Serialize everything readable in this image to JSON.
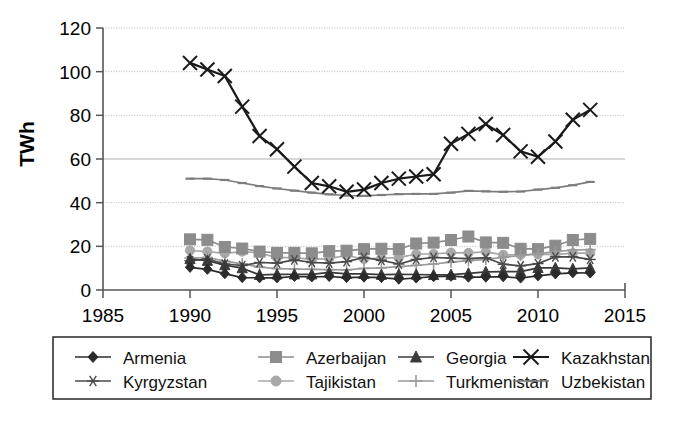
{
  "chart_data": {
    "type": "line",
    "title": "",
    "xlabel": "",
    "ylabel": "TWh",
    "xlim": [
      1985,
      2015
    ],
    "ylim": [
      0,
      120
    ],
    "xticks": [
      1985,
      1990,
      1995,
      2000,
      2005,
      2010,
      2015
    ],
    "yticks": [
      0,
      20,
      40,
      60,
      80,
      100,
      120
    ],
    "grid": "horizontal-dotted",
    "legend_position": "below-plot",
    "x": [
      1990,
      1991,
      1992,
      1993,
      1994,
      1995,
      1996,
      1997,
      1998,
      1999,
      2000,
      2001,
      2002,
      2003,
      2004,
      2005,
      2006,
      2007,
      2008,
      2009,
      2010,
      2011,
      2012,
      2013
    ],
    "series": [
      {
        "name": "Armenia",
        "marker": "diamond",
        "color": "#2b2b2b",
        "values": [
          10.4,
          9.5,
          7.5,
          5.7,
          5.6,
          5.6,
          6.2,
          6.0,
          6.2,
          5.7,
          5.9,
          5.7,
          5.0,
          5.5,
          6.1,
          6.3,
          5.9,
          5.9,
          6.1,
          5.5,
          6.5,
          7.4,
          7.9,
          7.8
        ]
      },
      {
        "name": "Azerbaijan",
        "marker": "square",
        "color": "#8c8c8c",
        "values": [
          23.2,
          23.0,
          19.7,
          19.0,
          17.6,
          17.0,
          17.0,
          16.8,
          17.8,
          18.0,
          18.7,
          18.9,
          18.7,
          21.3,
          21.7,
          22.9,
          24.5,
          21.8,
          21.6,
          18.9,
          18.7,
          20.3,
          22.9,
          23.4
        ]
      },
      {
        "name": "Georgia",
        "marker": "triangle",
        "color": "#3a3a3a",
        "values": [
          14.2,
          13.4,
          11.4,
          10.0,
          6.9,
          7.2,
          7.2,
          7.2,
          8.1,
          7.4,
          7.4,
          7.0,
          7.2,
          7.1,
          6.9,
          7.0,
          7.6,
          8.3,
          8.4,
          8.4,
          10.1,
          10.1,
          9.7,
          10.1
        ]
      },
      {
        "name": "Kazakhstan",
        "marker": "x",
        "color": "#1a1a1a",
        "values": [
          104.0,
          101.0,
          98.0,
          84.0,
          70.5,
          64.5,
          56.5,
          49.0,
          47.5,
          45.0,
          46.0,
          49.0,
          51.0,
          52.0,
          53.0,
          67.0,
          71.5,
          76.0,
          71.0,
          63.5,
          61.0,
          68.0,
          78.0,
          82.5
        ]
      },
      {
        "name": "Kyrgyzstan",
        "marker": "asterisk",
        "color": "#4a4a4a",
        "values": [
          13.4,
          14.2,
          11.9,
          11.2,
          12.6,
          12.3,
          13.8,
          12.6,
          12.3,
          13.0,
          14.9,
          13.6,
          11.9,
          14.0,
          14.9,
          14.6,
          14.4,
          14.8,
          11.8,
          11.1,
          12.1,
          15.2,
          15.2,
          14.0
        ]
      },
      {
        "name": "Tajikistan",
        "marker": "circle",
        "color": "#a8a8a8",
        "values": [
          18.1,
          17.6,
          16.8,
          17.6,
          17.0,
          14.8,
          14.8,
          14.0,
          14.4,
          15.8,
          14.2,
          14.6,
          14.8,
          16.5,
          16.5,
          17.1,
          17.0,
          17.5,
          16.1,
          16.1,
          16.4,
          16.2,
          16.9,
          16.9
        ]
      },
      {
        "name": "Turkmenistan",
        "marker": "plus",
        "color": "#9a9a9a",
        "values": [
          14.6,
          14.9,
          13.2,
          12.0,
          10.5,
          9.8,
          9.6,
          9.5,
          9.3,
          9.2,
          9.9,
          10.1,
          10.7,
          11.3,
          11.9,
          12.8,
          13.4,
          14.0,
          15.0,
          15.8,
          16.6,
          17.6,
          18.3,
          18.5
        ]
      },
      {
        "name": "Uzbekistan",
        "marker": "dash",
        "color": "#7d7d7d",
        "values": [
          51.0,
          51.0,
          50.4,
          49.0,
          47.6,
          46.5,
          45.5,
          44.6,
          43.8,
          43.3,
          43.1,
          43.5,
          43.9,
          44.0,
          44.0,
          44.6,
          45.4,
          45.2,
          45.0,
          45.1,
          46.0,
          46.8,
          48.0,
          49.5
        ]
      }
    ]
  },
  "axes": {
    "y_title": "TWh",
    "y_tick_labels": [
      "0",
      "20",
      "40",
      "60",
      "80",
      "100",
      "120"
    ],
    "x_tick_labels": [
      "1985",
      "1990",
      "1995",
      "2000",
      "2005",
      "2010",
      "2015"
    ]
  },
  "legend": {
    "entries": [
      {
        "label": "Armenia",
        "marker": "diamond",
        "color": "#2b2b2b"
      },
      {
        "label": "Azerbaijan",
        "marker": "square",
        "color": "#8c8c8c"
      },
      {
        "label": "Georgia",
        "marker": "triangle",
        "color": "#3a3a3a"
      },
      {
        "label": "Kazakhstan",
        "marker": "x",
        "color": "#1a1a1a"
      },
      {
        "label": "Kyrgyzstan",
        "marker": "asterisk",
        "color": "#4a4a4a"
      },
      {
        "label": "Tajikistan",
        "marker": "circle",
        "color": "#a8a8a8"
      },
      {
        "label": "Turkmenistan",
        "marker": "plus",
        "color": "#9a9a9a"
      },
      {
        "label": "Uzbekistan",
        "marker": "dash",
        "color": "#7d7d7d"
      }
    ]
  }
}
